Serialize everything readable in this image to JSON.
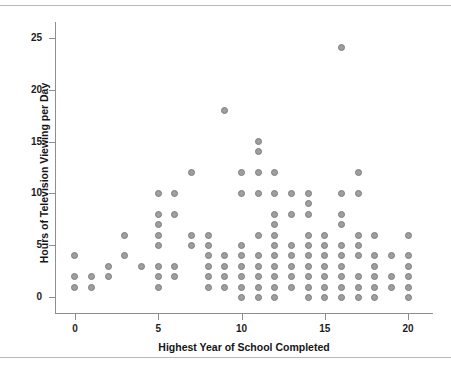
{
  "figure": {
    "width": 451,
    "height": 370,
    "background": "#ffffff",
    "rule_color": "#b9b9b9",
    "point_fill": "#9e9e9e",
    "point_stroke": "#7d7d7d",
    "axis_color": "#8e8e8e",
    "text_color": "#1d1d1d",
    "top_partial_text": ""
  },
  "chart_data": {
    "type": "scatter",
    "title": "",
    "xlabel": "Highest Year of School Completed",
    "ylabel": "Hours of Television Viewing per Day",
    "xlim": [
      -1.2,
      21.5
    ],
    "ylim": [
      -1.5,
      26.5
    ],
    "xticks": [
      0,
      5,
      10,
      15,
      20
    ],
    "xtick_labels": [
      "0",
      "5",
      "10",
      "15",
      "20"
    ],
    "yticks": [
      0,
      5,
      10,
      15,
      20,
      25
    ],
    "ytick_labels": [
      "0",
      "5",
      "10",
      "15",
      "20",
      "25"
    ],
    "grid": false,
    "legend": null,
    "marker": "circle",
    "points": [
      {
        "x": 0,
        "y": 1
      },
      {
        "x": 0,
        "y": 2
      },
      {
        "x": 0,
        "y": 4
      },
      {
        "x": 1,
        "y": 1
      },
      {
        "x": 1,
        "y": 2
      },
      {
        "x": 2,
        "y": 2
      },
      {
        "x": 2,
        "y": 3
      },
      {
        "x": 3,
        "y": 4
      },
      {
        "x": 3,
        "y": 6
      },
      {
        "x": 4,
        "y": 3
      },
      {
        "x": 5,
        "y": 1
      },
      {
        "x": 5,
        "y": 2
      },
      {
        "x": 5,
        "y": 3
      },
      {
        "x": 5,
        "y": 5
      },
      {
        "x": 5,
        "y": 6
      },
      {
        "x": 5,
        "y": 7
      },
      {
        "x": 5,
        "y": 8
      },
      {
        "x": 5,
        "y": 10
      },
      {
        "x": 6,
        "y": 2
      },
      {
        "x": 6,
        "y": 3
      },
      {
        "x": 6,
        "y": 8
      },
      {
        "x": 6,
        "y": 10
      },
      {
        "x": 7,
        "y": 5
      },
      {
        "x": 7,
        "y": 6
      },
      {
        "x": 7,
        "y": 12
      },
      {
        "x": 8,
        "y": 1
      },
      {
        "x": 8,
        "y": 2
      },
      {
        "x": 8,
        "y": 3
      },
      {
        "x": 8,
        "y": 4
      },
      {
        "x": 8,
        "y": 5
      },
      {
        "x": 8,
        "y": 6
      },
      {
        "x": 9,
        "y": 1
      },
      {
        "x": 9,
        "y": 2
      },
      {
        "x": 9,
        "y": 3
      },
      {
        "x": 9,
        "y": 4
      },
      {
        "x": 9,
        "y": 18
      },
      {
        "x": 10,
        "y": 0
      },
      {
        "x": 10,
        "y": 1
      },
      {
        "x": 10,
        "y": 2
      },
      {
        "x": 10,
        "y": 3
      },
      {
        "x": 10,
        "y": 4
      },
      {
        "x": 10,
        "y": 5
      },
      {
        "x": 10,
        "y": 10
      },
      {
        "x": 10,
        "y": 12
      },
      {
        "x": 11,
        "y": 0
      },
      {
        "x": 11,
        "y": 1
      },
      {
        "x": 11,
        "y": 2
      },
      {
        "x": 11,
        "y": 3
      },
      {
        "x": 11,
        "y": 4
      },
      {
        "x": 11,
        "y": 6
      },
      {
        "x": 11,
        "y": 10
      },
      {
        "x": 11,
        "y": 12
      },
      {
        "x": 11,
        "y": 14
      },
      {
        "x": 11,
        "y": 15
      },
      {
        "x": 12,
        "y": 0
      },
      {
        "x": 12,
        "y": 1
      },
      {
        "x": 12,
        "y": 2
      },
      {
        "x": 12,
        "y": 3
      },
      {
        "x": 12,
        "y": 4
      },
      {
        "x": 12,
        "y": 5
      },
      {
        "x": 12,
        "y": 6
      },
      {
        "x": 12,
        "y": 7
      },
      {
        "x": 12,
        "y": 8
      },
      {
        "x": 12,
        "y": 10
      },
      {
        "x": 12,
        "y": 12
      },
      {
        "x": 13,
        "y": 1
      },
      {
        "x": 13,
        "y": 2
      },
      {
        "x": 13,
        "y": 3
      },
      {
        "x": 13,
        "y": 4
      },
      {
        "x": 13,
        "y": 5
      },
      {
        "x": 13,
        "y": 8
      },
      {
        "x": 13,
        "y": 10
      },
      {
        "x": 14,
        "y": 0
      },
      {
        "x": 14,
        "y": 1
      },
      {
        "x": 14,
        "y": 2
      },
      {
        "x": 14,
        "y": 3
      },
      {
        "x": 14,
        "y": 4
      },
      {
        "x": 14,
        "y": 5
      },
      {
        "x": 14,
        "y": 6
      },
      {
        "x": 14,
        "y": 8
      },
      {
        "x": 14,
        "y": 9
      },
      {
        "x": 14,
        "y": 10
      },
      {
        "x": 15,
        "y": 0
      },
      {
        "x": 15,
        "y": 1
      },
      {
        "x": 15,
        "y": 2
      },
      {
        "x": 15,
        "y": 3
      },
      {
        "x": 15,
        "y": 4
      },
      {
        "x": 15,
        "y": 5
      },
      {
        "x": 15,
        "y": 6
      },
      {
        "x": 16,
        "y": 0
      },
      {
        "x": 16,
        "y": 1
      },
      {
        "x": 16,
        "y": 2
      },
      {
        "x": 16,
        "y": 3
      },
      {
        "x": 16,
        "y": 4
      },
      {
        "x": 16,
        "y": 5
      },
      {
        "x": 16,
        "y": 7
      },
      {
        "x": 16,
        "y": 8
      },
      {
        "x": 16,
        "y": 10
      },
      {
        "x": 16,
        "y": 24
      },
      {
        "x": 17,
        "y": 0
      },
      {
        "x": 17,
        "y": 1
      },
      {
        "x": 17,
        "y": 2
      },
      {
        "x": 17,
        "y": 4
      },
      {
        "x": 17,
        "y": 5
      },
      {
        "x": 17,
        "y": 6
      },
      {
        "x": 17,
        "y": 10
      },
      {
        "x": 17,
        "y": 12
      },
      {
        "x": 18,
        "y": 0
      },
      {
        "x": 18,
        "y": 1
      },
      {
        "x": 18,
        "y": 2
      },
      {
        "x": 18,
        "y": 3
      },
      {
        "x": 18,
        "y": 4
      },
      {
        "x": 18,
        "y": 6
      },
      {
        "x": 19,
        "y": 1
      },
      {
        "x": 19,
        "y": 2
      },
      {
        "x": 19,
        "y": 4
      },
      {
        "x": 20,
        "y": 0
      },
      {
        "x": 20,
        "y": 1
      },
      {
        "x": 20,
        "y": 2
      },
      {
        "x": 20,
        "y": 3
      },
      {
        "x": 20,
        "y": 4
      },
      {
        "x": 20,
        "y": 6
      }
    ]
  }
}
